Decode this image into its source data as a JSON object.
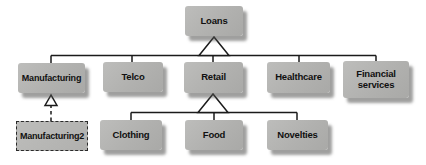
{
  "diagram": {
    "type": "hierarchy",
    "root": "Loans",
    "nodes": {
      "loans": {
        "label": "Loans",
        "style": "solid"
      },
      "manufacturing": {
        "label": "Manufacturing",
        "style": "solid"
      },
      "telco": {
        "label": "Telco",
        "style": "solid"
      },
      "retail": {
        "label": "Retail",
        "style": "solid"
      },
      "healthcare": {
        "label": "Healthcare",
        "style": "solid"
      },
      "financial_services": {
        "label": "Financial services",
        "style": "solid"
      },
      "manufacturing2": {
        "label": "Manufacturing2",
        "style": "dashed"
      },
      "clothing": {
        "label": "Clothing",
        "style": "solid"
      },
      "food": {
        "label": "Food",
        "style": "solid"
      },
      "novelties": {
        "label": "Novelties",
        "style": "solid"
      }
    },
    "edges": [
      {
        "parent": "Loans",
        "children": [
          "Manufacturing",
          "Telco",
          "Retail",
          "Healthcare",
          "Financial services"
        ],
        "connector": "hollow-triangle"
      },
      {
        "parent": "Retail",
        "children": [
          "Clothing",
          "Food",
          "Novelties"
        ],
        "connector": "hollow-triangle"
      },
      {
        "from": "Manufacturing2",
        "to": "Manufacturing",
        "connector": "dashed-hollow-arrow"
      }
    ],
    "colors": {
      "background": "#ffffff",
      "node_fill": "#b3b3b1",
      "node_shadow": "#8f8f8d",
      "line": "#1b1b1b",
      "text": "#101010"
    }
  }
}
